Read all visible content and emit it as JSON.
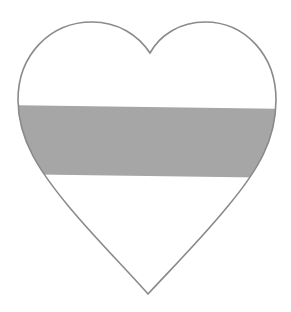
{
  "figure": {
    "shape": "heart",
    "colors": {
      "background": "#ffffff",
      "heart_fill": "#ffffff",
      "outline": "#8a8a8a",
      "band": "#a6a6a6"
    },
    "band": {
      "left_top_y": 105,
      "left_bottom_y": 174,
      "right_top_y": 109,
      "right_bottom_y": 178
    }
  }
}
